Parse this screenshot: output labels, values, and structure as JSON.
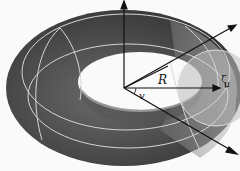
{
  "diagram": {
    "labels": {
      "major_radius": "R",
      "minor_radius": "r",
      "poloidal_angle": "u",
      "toroidal_angle": "v"
    },
    "axes": [
      "vertical-axis",
      "x-axis-arrow",
      "y-axis-arrow"
    ],
    "colors": {
      "torus_dark": "#3a3a3a",
      "torus_mid": "#5e5e5e",
      "torus_light": "#9a9a9a",
      "cross_section": "#b8b8b8",
      "grid_lines": "#d8d8d8",
      "arrows": "#111111",
      "background": "#fafafa"
    }
  }
}
